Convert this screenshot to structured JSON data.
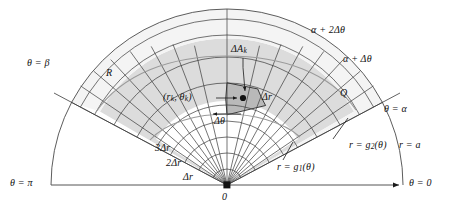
{
  "figure": {
    "colors": {
      "ink": "#1a1a1a",
      "grid": "#333333",
      "curve_g": "#8f8f8f",
      "fill_region": "#dcdcdc",
      "fill_cell": "#b4b4b4",
      "fill_outer": "#e8e8e8",
      "axis": "#555555"
    },
    "geometry": {
      "origin_x": 227,
      "origin_y": 185,
      "outer_radius_a": 176,
      "ray_count": 9,
      "arc_count": 8,
      "delta_r": 16,
      "alpha_deg": 28,
      "beta_deg": 152
    }
  },
  "labels": {
    "theta_pi": "θ = π",
    "theta_zero": "θ = 0",
    "theta_alpha": "θ = α",
    "theta_beta": "θ = β",
    "alpha_plus_dtheta": "α + Δθ",
    "alpha_plus_2dtheta": "α + 2Δθ",
    "r_equals_a": "r = a",
    "r_equals_g1": "r = g",
    "r_equals_g1_sub": "1",
    "r_equals_g1_tail": "(θ)",
    "r_equals_g2": "r = g",
    "r_equals_g2_sub": "2",
    "r_equals_g2_tail": "(θ)",
    "region_R": "R",
    "region_Q": "Q",
    "delta_A_k": "ΔA",
    "delta_A_k_sub": "k",
    "point_rk_theta_k_open": "(r",
    "point_rk_sub": "k",
    "point_mid": ", θ",
    "point_theta_sub": "k",
    "point_close": ")",
    "delta_r": "Δr",
    "delta_theta": "Δθ",
    "two_delta_r": "2Δr",
    "three_delta_r": "3Δr",
    "origin": "0"
  }
}
